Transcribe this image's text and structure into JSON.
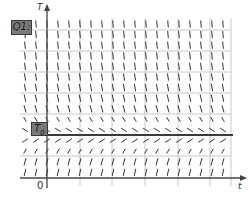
{
  "diagram": {
    "y_axis_label": "T",
    "x_axis_label": "t",
    "origin_label": "0",
    "question_label": "Q1:",
    "equilibrium_label": "T",
    "equilibrium_subscript": "0",
    "colors": {
      "background": "#ffffff",
      "grid": "#c8c8c8",
      "axis": "#444444",
      "slope_marks": "#333333",
      "equilibrium_line": "#3a3a3a",
      "label_box_fill": "#7a7a7a"
    },
    "geometry": {
      "origin_x": 47,
      "origin_y": 178,
      "grid_left": 20,
      "grid_right": 231,
      "grid_top": 18,
      "equilibrium_y": 135,
      "vertical_gridlines_x": [
        80,
        112,
        145,
        178,
        210,
        231
      ],
      "horizontal_gridlines_y": [
        30,
        51,
        72,
        93,
        114,
        156
      ],
      "slope_columns_start_x": 25,
      "slope_column_spacing": 11,
      "slope_rows_start_y": 24,
      "slope_row_spacing": 10.6,
      "slope_rows_count": 16
    },
    "equation_hint": "dT/dt = k(T0 - T)"
  }
}
